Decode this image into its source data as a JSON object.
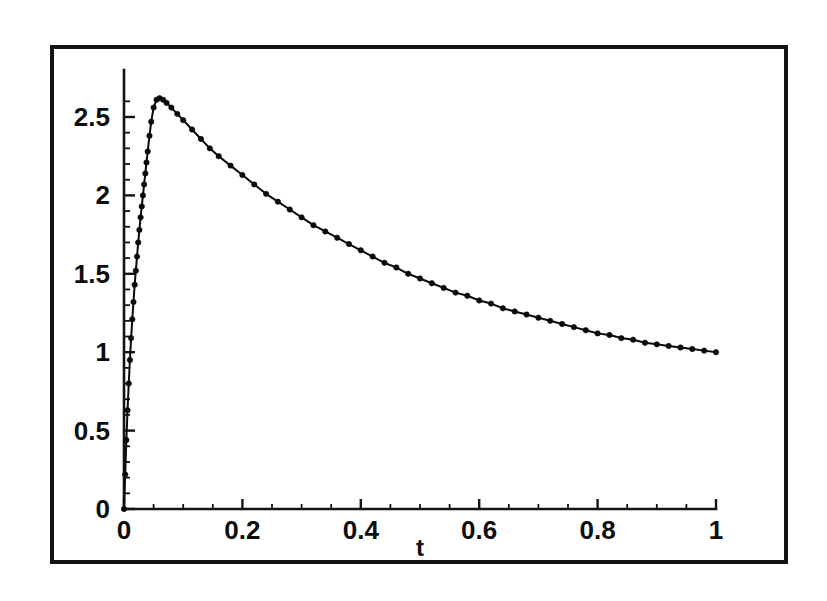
{
  "figure": {
    "background_color": "#ffffff",
    "ink_color": "#0d0d0d",
    "frame": {
      "x": 50,
      "y": 45,
      "width": 738,
      "height": 519
    }
  },
  "axes": {
    "x_title": "t",
    "y_title": "",
    "x_ticks": [
      "0",
      "0.2",
      "0.4",
      "0.6",
      "0.8",
      "1"
    ],
    "y_ticks": [
      "0",
      "0.5",
      "1",
      "1.5",
      "2",
      "2.5"
    ],
    "x_minor_step": 0.05,
    "y_minor_step": 0.1,
    "origin_px": {
      "x": 124,
      "y": 509
    },
    "x_unit_px": 592,
    "y_unit_px": 156.8
  },
  "chart_data": {
    "type": "line",
    "title": "",
    "subtitle": "",
    "xlabel": "t",
    "ylabel": "",
    "xlim": [
      0,
      1
    ],
    "ylim": [
      0,
      2.8
    ],
    "grid": false,
    "legend": null,
    "markers": "filled-circle",
    "x_ticks": [
      0,
      0.2,
      0.4,
      0.6,
      0.8,
      1
    ],
    "y_ticks": [
      0,
      0.5,
      1,
      1.5,
      2,
      2.5
    ],
    "series": [
      {
        "name": "curve",
        "x": [
          0.0,
          0.002,
          0.004,
          0.006,
          0.008,
          0.01,
          0.012,
          0.014,
          0.016,
          0.018,
          0.02,
          0.022,
          0.024,
          0.026,
          0.028,
          0.03,
          0.032,
          0.034,
          0.036,
          0.038,
          0.04,
          0.043,
          0.046,
          0.05,
          0.055,
          0.06,
          0.066,
          0.072,
          0.08,
          0.09,
          0.1,
          0.115,
          0.13,
          0.145,
          0.16,
          0.18,
          0.2,
          0.22,
          0.24,
          0.26,
          0.28,
          0.3,
          0.32,
          0.34,
          0.36,
          0.38,
          0.4,
          0.42,
          0.44,
          0.46,
          0.48,
          0.5,
          0.52,
          0.54,
          0.56,
          0.58,
          0.6,
          0.62,
          0.64,
          0.66,
          0.68,
          0.7,
          0.72,
          0.74,
          0.76,
          0.78,
          0.8,
          0.82,
          0.84,
          0.86,
          0.88,
          0.9,
          0.92,
          0.94,
          0.96,
          0.98,
          1.0
        ],
        "y": [
          0.0,
          0.22,
          0.44,
          0.63,
          0.8,
          0.95,
          1.09,
          1.21,
          1.32,
          1.43,
          1.52,
          1.61,
          1.7,
          1.78,
          1.86,
          1.93,
          2.0,
          2.07,
          2.14,
          2.21,
          2.28,
          2.38,
          2.47,
          2.56,
          2.61,
          2.62,
          2.61,
          2.59,
          2.56,
          2.52,
          2.48,
          2.42,
          2.36,
          2.3,
          2.25,
          2.19,
          2.13,
          2.07,
          2.01,
          1.96,
          1.91,
          1.86,
          1.81,
          1.77,
          1.73,
          1.69,
          1.65,
          1.61,
          1.57,
          1.54,
          1.5,
          1.47,
          1.44,
          1.41,
          1.38,
          1.36,
          1.33,
          1.31,
          1.28,
          1.26,
          1.24,
          1.22,
          1.2,
          1.18,
          1.16,
          1.14,
          1.12,
          1.11,
          1.09,
          1.08,
          1.06,
          1.05,
          1.04,
          1.03,
          1.02,
          1.01,
          1.0
        ],
        "peak": {
          "x": 0.06,
          "y": 2.62
        },
        "endpoint": {
          "x": 1.0,
          "y": 1.0
        },
        "start": {
          "x": 0.0,
          "y": 0.0
        }
      }
    ]
  }
}
